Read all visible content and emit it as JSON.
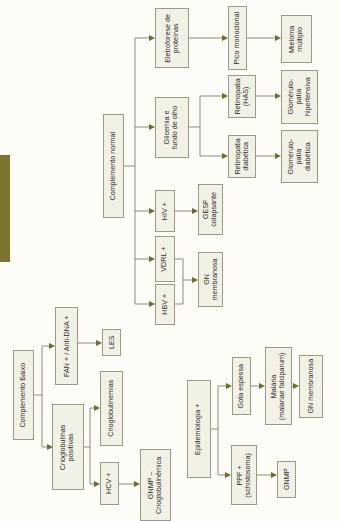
{
  "diagram": {
    "orientation": "rotated 90 degrees counter-clockwise",
    "accent_color": "#7a7430",
    "connector_color": "#8c8c7c",
    "arrow_color": "#6f6b2c",
    "nodes": {
      "complemento_normal": "Complemento normal",
      "eletroforese": "Eletroforese de\nproteínas",
      "glicemia": "Glicemia e\nfundo de olho",
      "hiv": "HIV +",
      "vdrl": "VDRL +",
      "hbv": "HBV +",
      "gesf": "GESF\ncolapsante",
      "gn_membranosa_1": "GN\nmembranosa",
      "pico_monoclonal": "Pico monoclonal",
      "retinopatia_has": "Retinopatia\n(HAS)",
      "retinopatia_diabetica": "Retinopatia\ndiabética",
      "mieloma": "Mieloma\nmúltiplo",
      "glomerulopatia_hipertensiva": "Glomérulo-\npatia\nhipertensiva",
      "glomerulopatia_diabetica": "Glomérulo-\npatia\ndiabética",
      "complemento_baixo": "Complemento Baixo",
      "fan": "FAN + / Anti-DNA +",
      "les": "LES",
      "crioglobulinas": "Crioglobulinas\npositivas",
      "crioglobulinemias": "Crioglobulinemias",
      "hcv": "HCV +",
      "gnmp_crio": "GNMP –\nCrioglobulinêmica",
      "epidemiologia": "Epidemiologia +",
      "gota_espessa": "Gota espessa",
      "ppf": "PPF +\n(schistosoma)",
      "malaria": "Malária\n(malariae falciparum)",
      "gnmp": "GNMP",
      "gn_membranosa_2": "GN membranosa"
    },
    "edges": [
      [
        "complemento_normal",
        "eletroforese"
      ],
      [
        "complemento_normal",
        "glicemia"
      ],
      [
        "complemento_normal",
        "hiv"
      ],
      [
        "complemento_normal",
        "vdrl"
      ],
      [
        "complemento_normal",
        "hbv"
      ],
      [
        "eletroforese",
        "pico_monoclonal"
      ],
      [
        "pico_monoclonal",
        "mieloma"
      ],
      [
        "glicemia",
        "retinopatia_has"
      ],
      [
        "glicemia",
        "retinopatia_diabetica"
      ],
      [
        "retinopatia_has",
        "glomerulopatia_hipertensiva"
      ],
      [
        "retinopatia_diabetica",
        "glomerulopatia_diabetica"
      ],
      [
        "hiv",
        "gesf"
      ],
      [
        "vdrl",
        "gn_membranosa_1"
      ],
      [
        "hbv",
        "gn_membranosa_1"
      ],
      [
        "complemento_baixo",
        "fan"
      ],
      [
        "complemento_baixo",
        "crioglobulinas"
      ],
      [
        "fan",
        "les"
      ],
      [
        "crioglobulinas",
        "crioglobulinemias"
      ],
      [
        "crioglobulinas",
        "hcv"
      ],
      [
        "hcv",
        "gnmp_crio"
      ],
      [
        "epidemiologia",
        "gota_espessa"
      ],
      [
        "epidemiologia",
        "ppf"
      ],
      [
        "gota_espessa",
        "malaria"
      ],
      [
        "malaria",
        "gn_membranosa_2"
      ],
      [
        "ppf",
        "gnmp"
      ]
    ]
  }
}
